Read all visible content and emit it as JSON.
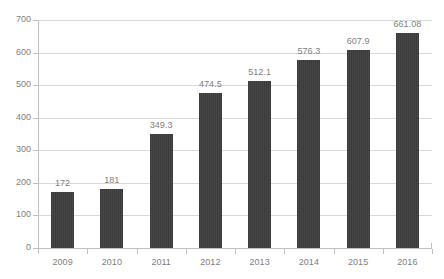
{
  "chart_data": {
    "type": "bar",
    "title": "",
    "subtitle": "",
    "xlabel": "",
    "ylabel": "",
    "categories": [
      "2009",
      "2010",
      "2011",
      "2012",
      "2013",
      "2014",
      "2015",
      "2016"
    ],
    "values": [
      172,
      181,
      349.3,
      474.5,
      512.1,
      576.3,
      607.9,
      661.08
    ],
    "data_labels": [
      "172",
      "181",
      "349.3",
      "474.5",
      "512.1",
      "576.3",
      "607.9",
      "661.08"
    ],
    "ylim": [
      0,
      700
    ],
    "y_ticks": [
      0,
      100,
      200,
      300,
      400,
      500,
      600,
      700
    ],
    "y_tick_labels": [
      "0",
      "100",
      "200",
      "300",
      "400",
      "500",
      "600",
      "700"
    ],
    "grid": true,
    "grid_axis": "y",
    "legend": false,
    "legend_position": "none",
    "series": [
      {
        "name": "",
        "values": [
          172,
          181,
          349.3,
          474.5,
          512.1,
          576.3,
          607.9,
          661.08
        ],
        "color": "#3b3b3b"
      }
    ],
    "colors": {
      "bar": "#3b3b3b",
      "gridline": "#d9d9d9",
      "axis": "#bfbfbf",
      "label_text": "#808080",
      "background": "#ffffff"
    }
  }
}
